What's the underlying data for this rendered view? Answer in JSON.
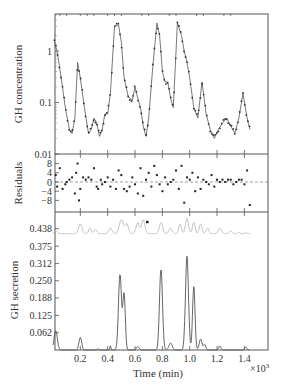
{
  "chart_data": [
    {
      "type": "line",
      "panel": "top",
      "ylabel": "GH concentration",
      "yscale": "log",
      "ylim": [
        0.01,
        5
      ],
      "yticks": [
        {
          "label": "1",
          "value": 1
        },
        {
          "label": "0.1",
          "value": 0.1
        },
        {
          "label": "0.01",
          "value": 0.01
        }
      ],
      "series": [
        {
          "name": "fit",
          "style": "line",
          "color": "#555555",
          "x": [
            0.01,
            0.03,
            0.06,
            0.09,
            0.12,
            0.14,
            0.16,
            0.18,
            0.2,
            0.23,
            0.26,
            0.28,
            0.3,
            0.32,
            0.34,
            0.36,
            0.38,
            0.4,
            0.42,
            0.45,
            0.48,
            0.5,
            0.52,
            0.55,
            0.58,
            0.6,
            0.62,
            0.64,
            0.66,
            0.68,
            0.7,
            0.73,
            0.76,
            0.78,
            0.8,
            0.82,
            0.84,
            0.86,
            0.88,
            0.91,
            0.94,
            0.96,
            0.98,
            1.0,
            1.03,
            1.06,
            1.09,
            1.12,
            1.15,
            1.18,
            1.21,
            1.24,
            1.27,
            1.3,
            1.33,
            1.36,
            1.39,
            1.42,
            1.44
          ],
          "y": [
            1.5,
            1.0,
            0.3,
            0.08,
            0.03,
            0.025,
            0.05,
            0.6,
            0.3,
            0.08,
            0.025,
            0.03,
            0.05,
            0.04,
            0.022,
            0.03,
            0.06,
            0.06,
            0.15,
            3.0,
            3.2,
            1.5,
            0.3,
            0.13,
            0.11,
            0.2,
            0.12,
            0.08,
            0.035,
            0.022,
            0.05,
            0.5,
            3.5,
            2.0,
            0.4,
            0.25,
            0.25,
            0.12,
            0.08,
            3.5,
            2.0,
            1.0,
            0.6,
            0.3,
            0.08,
            0.05,
            0.25,
            0.06,
            0.03,
            0.02,
            0.03,
            0.04,
            0.05,
            0.035,
            0.025,
            0.05,
            0.15,
            0.05,
            0.03
          ]
        },
        {
          "name": "data",
          "style": "points",
          "color": "#333333"
        }
      ]
    },
    {
      "type": "scatter",
      "panel": "middle",
      "ylabel": "Residuals",
      "ylim": [
        -13,
        12
      ],
      "yticks": [
        8,
        4,
        0,
        -4,
        -8
      ],
      "zero_line": "dashed",
      "series": [
        {
          "name": "residuals",
          "x": [
            0.02,
            0.03,
            0.05,
            0.07,
            0.09,
            0.1,
            0.12,
            0.14,
            0.16,
            0.17,
            0.18,
            0.19,
            0.2,
            0.22,
            0.24,
            0.26,
            0.28,
            0.3,
            0.32,
            0.33,
            0.35,
            0.36,
            0.38,
            0.4,
            0.42,
            0.44,
            0.46,
            0.48,
            0.5,
            0.52,
            0.54,
            0.56,
            0.58,
            0.6,
            0.62,
            0.64,
            0.66,
            0.68,
            0.7,
            0.72,
            0.74,
            0.76,
            0.78,
            0.8,
            0.82,
            0.84,
            0.86,
            0.88,
            0.9,
            0.92,
            0.94,
            0.96,
            0.98,
            1.0,
            1.02,
            1.04,
            1.06,
            1.08,
            1.1,
            1.12,
            1.14,
            1.16,
            1.18,
            1.2,
            1.22,
            1.24,
            1.26,
            1.28,
            1.3,
            1.32,
            1.34,
            1.36,
            1.38,
            1.4,
            1.42,
            1.44
          ],
          "y": [
            3,
            -2,
            6,
            -3,
            -1,
            0,
            1,
            2,
            -5,
            4,
            8,
            -8,
            -3,
            2,
            1,
            2,
            1,
            6,
            -2,
            -3,
            1,
            -1,
            0,
            2,
            -2,
            1,
            -3,
            5,
            3,
            -3,
            -4,
            -2,
            2,
            -1,
            -5,
            6,
            -6,
            1,
            4,
            -2,
            7,
            3,
            -1,
            -4,
            2,
            -1,
            0,
            1,
            5,
            -3,
            7,
            -9,
            2,
            1,
            4,
            -4,
            2,
            -3,
            1,
            0,
            -1,
            3,
            -2,
            1,
            0,
            1,
            0,
            1,
            1,
            -1,
            0,
            1,
            1,
            -1,
            5,
            -10
          ]
        }
      ]
    },
    {
      "type": "line",
      "panel": "bottom",
      "ylabel": "GH secretion",
      "xlabel": "Time (min)",
      "x_multiplier": "×10³",
      "ylim": [
        0,
        0.5
      ],
      "xlim": [
        0,
        1.58
      ],
      "yticks": [
        0.438,
        0.375,
        0.312,
        0.25,
        0.188,
        0.125,
        0.062
      ],
      "xticks": [
        0.2,
        0.4,
        0.6,
        0.8,
        1.0,
        1.2,
        1.4
      ],
      "series": [
        {
          "name": "secretion",
          "style": "line",
          "color": "#555555",
          "peaks": [
            {
              "x": 0.02,
              "y": 0.07,
              "w": 0.012
            },
            {
              "x": 0.2,
              "y": 0.045,
              "w": 0.01
            },
            {
              "x": 0.33,
              "y": 0.005,
              "w": 0.006
            },
            {
              "x": 0.42,
              "y": 0.015,
              "w": 0.004
            },
            {
              "x": 0.49,
              "y": 0.272,
              "w": 0.011
            },
            {
              "x": 0.52,
              "y": 0.2,
              "w": 0.009
            },
            {
              "x": 0.62,
              "y": 0.012,
              "w": 0.01
            },
            {
              "x": 0.79,
              "y": 0.29,
              "w": 0.011
            },
            {
              "x": 0.86,
              "y": 0.025,
              "w": 0.012
            },
            {
              "x": 0.98,
              "y": 0.34,
              "w": 0.011
            },
            {
              "x": 1.03,
              "y": 0.23,
              "w": 0.009
            },
            {
              "x": 1.08,
              "y": 0.04,
              "w": 0.01
            },
            {
              "x": 1.11,
              "y": 0.02,
              "w": 0.008
            },
            {
              "x": 1.22,
              "y": 0.015,
              "w": 0.008
            },
            {
              "x": 1.41,
              "y": 0.01,
              "w": 0.008
            }
          ]
        },
        {
          "name": "secretion-prior",
          "style": "line",
          "color": "#bbbbbb",
          "baseline": 0.42,
          "peaks": [
            {
              "x": 0.02,
              "y": 0.43,
              "w": 0.012
            },
            {
              "x": 0.2,
              "y": 0.455,
              "w": 0.012
            },
            {
              "x": 0.27,
              "y": 0.44,
              "w": 0.01
            },
            {
              "x": 0.31,
              "y": 0.435,
              "w": 0.01
            },
            {
              "x": 0.42,
              "y": 0.44,
              "w": 0.012
            },
            {
              "x": 0.5,
              "y": 0.47,
              "w": 0.015
            },
            {
              "x": 0.54,
              "y": 0.455,
              "w": 0.012
            },
            {
              "x": 0.62,
              "y": 0.46,
              "w": 0.012
            },
            {
              "x": 0.66,
              "y": 0.47,
              "w": 0.012
            },
            {
              "x": 0.79,
              "y": 0.46,
              "w": 0.012
            },
            {
              "x": 0.86,
              "y": 0.44,
              "w": 0.012
            },
            {
              "x": 0.93,
              "y": 0.455,
              "w": 0.01
            },
            {
              "x": 0.98,
              "y": 0.475,
              "w": 0.011
            },
            {
              "x": 1.03,
              "y": 0.46,
              "w": 0.01
            },
            {
              "x": 1.08,
              "y": 0.455,
              "w": 0.01
            },
            {
              "x": 1.13,
              "y": 0.44,
              "w": 0.01
            },
            {
              "x": 1.22,
              "y": 0.44,
              "w": 0.012
            },
            {
              "x": 1.3,
              "y": 0.43,
              "w": 0.01
            },
            {
              "x": 1.36,
              "y": 0.425,
              "w": 0.008
            },
            {
              "x": 1.41,
              "y": 0.423,
              "w": 0.008
            }
          ]
        },
        {
          "name": "marker",
          "style": "point",
          "x": 0.69,
          "y": 0.462
        }
      ]
    }
  ],
  "labels": {
    "top_ylabel": "GH concentration",
    "mid_ylabel": "Residuals",
    "bot_ylabel": "GH secretion",
    "xlabel": "Time (min)",
    "x_multiplier": "×10",
    "x_multiplier_exp": "3",
    "top_ticks": [
      "1",
      "0.1",
      "0.01"
    ],
    "mid_ticks": [
      "8",
      "4",
      "0",
      "−4",
      "−8"
    ],
    "bot_ticks": [
      "0.438",
      "0.375",
      "0.312",
      "0.250",
      "0.188",
      "0.125",
      "0.062"
    ],
    "x_ticks": [
      "0.2",
      "0.4",
      "0.6",
      "0.8",
      "1.0",
      "1.2",
      "1.4"
    ]
  }
}
